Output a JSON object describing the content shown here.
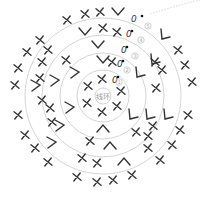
{
  "diagram": {
    "type": "crochet-round-chart",
    "center_label": "线环",
    "center": [
      103,
      96
    ],
    "rings_radii": [
      8,
      26,
      43,
      61,
      78
    ],
    "round_markers": [
      {
        "label": "①",
        "n": "1",
        "x": 119,
        "y": 82
      },
      {
        "label": "②",
        "n": "2",
        "x": 127,
        "y": 70
      },
      {
        "label": "③",
        "n": "3",
        "x": 135,
        "y": 56
      },
      {
        "label": "④",
        "n": "4",
        "x": 141,
        "y": 40
      },
      {
        "label": "⑤",
        "n": "5",
        "x": 148,
        "y": 26
      }
    ],
    "chain_starts": [
      {
        "x": 112,
        "y": 80,
        "dotx": 118,
        "doty": 77
      },
      {
        "x": 117,
        "y": 64,
        "dotx": 123,
        "doty": 61
      },
      {
        "x": 121,
        "y": 50,
        "dotx": 127,
        "doty": 47
      },
      {
        "x": 126,
        "y": 34,
        "dotx": 132,
        "doty": 31
      },
      {
        "x": 131,
        "y": 19,
        "dotx": 142,
        "doty": 16
      }
    ],
    "legend": {
      "X": "single crochet",
      "V": "increase",
      "A": "decrease",
      "0": "chain",
      "dot": "slip stitch"
    },
    "symbols": {
      "x": [
        [
          102,
          79
        ],
        [
          88,
          86
        ],
        [
          121,
          91
        ],
        [
          87,
          103
        ],
        [
          117,
          106
        ],
        [
          102,
          112
        ],
        [
          112,
          62
        ],
        [
          66,
          60
        ],
        [
          156,
          88
        ],
        [
          90,
          141
        ],
        [
          136,
          132
        ],
        [
          103,
          28
        ],
        [
          117,
          32
        ],
        [
          48,
          50
        ],
        [
          42,
          62
        ],
        [
          40,
          78
        ],
        [
          42,
          100
        ],
        [
          50,
          108
        ],
        [
          52,
          122
        ],
        [
          155,
          62
        ],
        [
          162,
          70
        ],
        [
          148,
          136
        ],
        [
          153,
          126
        ],
        [
          148,
          148
        ],
        [
          82,
          158
        ],
        [
          97,
          163
        ],
        [
          67,
          20
        ],
        [
          85,
          14
        ],
        [
          100,
          12
        ],
        [
          40,
          40
        ],
        [
          27,
          52
        ],
        [
          18,
          68
        ],
        [
          15,
          85
        ],
        [
          18,
          115
        ],
        [
          25,
          135
        ],
        [
          35,
          148
        ],
        [
          48,
          162
        ],
        [
          178,
          50
        ],
        [
          185,
          65
        ],
        [
          192,
          82
        ],
        [
          188,
          115
        ],
        [
          180,
          130
        ],
        [
          172,
          145
        ],
        [
          160,
          160
        ],
        [
          77,
          177
        ],
        [
          97,
          182
        ],
        [
          113,
          180
        ],
        [
          132,
          175
        ]
      ],
      "v": [
        [
          103,
          60
        ],
        [
          98,
          45
        ],
        [
          85,
          32
        ],
        [
          118,
          12
        ]
      ],
      "a": [
        [
          103,
          128
        ],
        [
          110,
          145
        ],
        [
          124,
          161
        ]
      ],
      "l": [
        [
          75,
          72,
          0
        ],
        [
          55,
          80,
          0
        ],
        [
          36,
          85,
          0
        ],
        [
          70,
          107,
          0
        ],
        [
          60,
          125,
          0
        ],
        [
          52,
          142,
          0
        ],
        [
          140,
          73,
          1
        ],
        [
          155,
          60,
          1
        ],
        [
          165,
          35,
          1
        ],
        [
          133,
          115,
          1
        ],
        [
          150,
          115,
          1
        ],
        [
          168,
          115,
          1
        ]
      ]
    }
  }
}
